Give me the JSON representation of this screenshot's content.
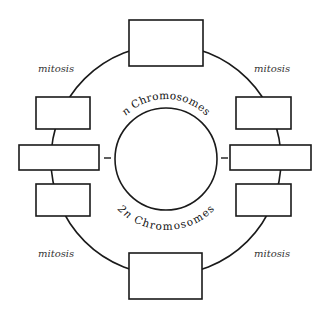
{
  "diagram": {
    "inner_label_top": {
      "prefix": "n",
      "text": " Chromosomes"
    },
    "inner_label_bottom": {
      "prefix": "2n",
      "text": " Chromosomes"
    },
    "corner_labels": [
      {
        "position": "top-left",
        "text": "mitosis"
      },
      {
        "position": "top-right",
        "text": "mitosis"
      },
      {
        "position": "bottom-left",
        "text": "mitosis"
      },
      {
        "position": "bottom-right",
        "text": "mitosis"
      }
    ],
    "boxes": [
      {
        "id": "top",
        "text": ""
      },
      {
        "id": "left-upper",
        "text": ""
      },
      {
        "id": "left-middle",
        "text": ""
      },
      {
        "id": "left-lower",
        "text": ""
      },
      {
        "id": "right-upper",
        "text": ""
      },
      {
        "id": "right-middle",
        "text": ""
      },
      {
        "id": "right-lower",
        "text": ""
      },
      {
        "id": "bottom",
        "text": ""
      }
    ],
    "colors": {
      "line": "#1a1a1a",
      "label": "#333333",
      "background": "#ffffff"
    }
  }
}
